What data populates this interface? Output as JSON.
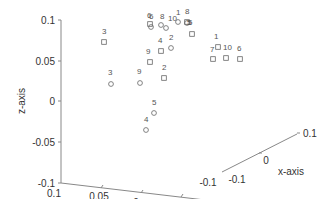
{
  "chart_data": {
    "type": "scatter",
    "projection": "3d",
    "title": "",
    "xlabel": "x-axis",
    "ylabel": "y-axis",
    "zlabel": "z-axis",
    "xlim": [
      -0.1,
      0.1
    ],
    "ylim": [
      -0.1,
      0.1
    ],
    "zlim": [
      -0.1,
      0.1
    ],
    "x_ticks": [
      "-0.1",
      "0",
      "0.1"
    ],
    "y_ticks": [
      "0.1",
      "0.05",
      "0",
      "-0.05",
      "-0.1"
    ],
    "z_ticks": [
      "0.1",
      "0.05",
      "0",
      "-0.05",
      "-0.1"
    ],
    "grid": false,
    "legend": null,
    "series": [
      {
        "name": "circles",
        "marker": "circle",
        "points": [
          {
            "label": "6",
            "px": [
              151,
              27
            ],
            "lpx": [
              149,
              19
            ]
          },
          {
            "label": "8",
            "px": [
              161,
              25
            ],
            "lpx": [
              160,
              19
            ]
          },
          {
            "label": "10",
            "px": [
              166,
              28
            ],
            "lpx": [
              168,
              21
            ]
          },
          {
            "label": "1",
            "px": [
              178,
              22
            ],
            "lpx": [
              176,
              15
            ]
          },
          {
            "label": "5",
            "px": [
              187,
              23
            ],
            "lpx": [
              188,
              25
            ]
          },
          {
            "label": "2",
            "px": [
              171,
              48
            ],
            "lpx": [
              169,
              40
            ]
          },
          {
            "label": "9",
            "px": [
              140,
              83
            ],
            "lpx": [
              137,
              74
            ]
          },
          {
            "label": "3",
            "px": [
              111,
              84
            ],
            "lpx": [
              108,
              75
            ]
          },
          {
            "label": "5",
            "px": [
              154,
              113
            ],
            "lpx": [
              152,
              105
            ]
          },
          {
            "label": "4",
            "px": [
              146,
              130
            ],
            "lpx": [
              144,
              122
            ]
          }
        ]
      },
      {
        "name": "squares",
        "marker": "square",
        "points": [
          {
            "label": "6",
            "px": [
              150,
              24
            ],
            "lpx": [
              147,
              18
            ]
          },
          {
            "label": "3",
            "px": [
              104,
              42
            ],
            "lpx": [
              102,
              34
            ]
          },
          {
            "label": "4",
            "px": [
              161,
              51
            ],
            "lpx": [
              158,
              43
            ]
          },
          {
            "label": "9",
            "px": [
              150,
              62
            ],
            "lpx": [
              146,
              54
            ]
          },
          {
            "label": "2",
            "px": [
              164,
              78
            ],
            "lpx": [
              162,
              70
            ]
          },
          {
            "label": "8",
            "px": [
              187,
              22
            ],
            "lpx": [
              185,
              14
            ]
          },
          {
            "label": "5",
            "px": [
              192,
              34
            ],
            "lpx": [
              187,
              25
            ]
          },
          {
            "label": "1",
            "px": [
              218,
              47
            ],
            "lpx": [
              214,
              39
            ]
          },
          {
            "label": "7",
            "px": [
              213,
              59
            ],
            "lpx": [
              210,
              52
            ]
          },
          {
            "label": "10",
            "px": [
              226,
              58
            ],
            "lpx": [
              223,
              50
            ]
          },
          {
            "label": "6",
            "px": [
              240,
              59
            ],
            "lpx": [
              237,
              51
            ]
          }
        ]
      }
    ]
  },
  "axes_geometry": {
    "z_axis": {
      "x": 61,
      "y_top": 20,
      "y_bottom": 183
    },
    "y_axis": {
      "start": [
        61,
        183
      ],
      "end": [
        222,
        205
      ]
    },
    "x_axis": {
      "start": [
        222,
        173
      ],
      "end": [
        297,
        133
      ]
    }
  }
}
